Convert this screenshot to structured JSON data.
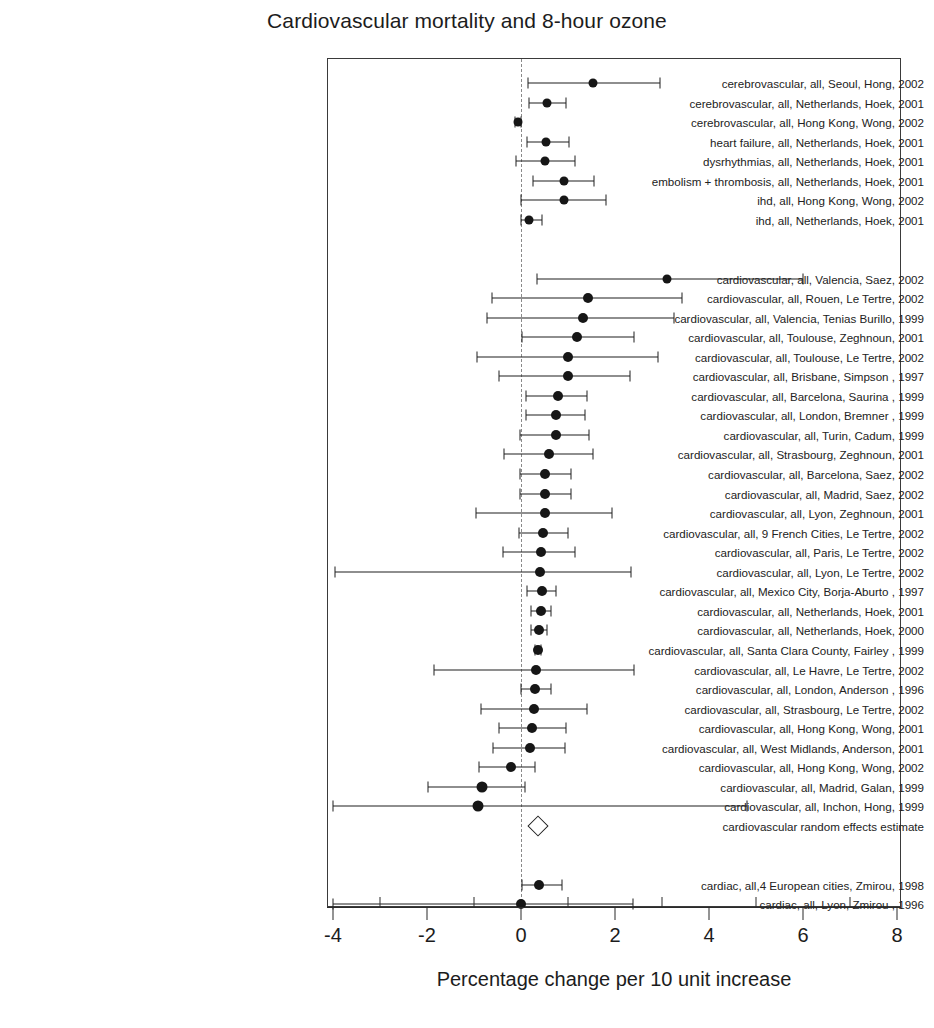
{
  "title": "Cardiovascular mortality and 8-hour ozone",
  "axis": {
    "xlabel": "Percentage change per 10 unit increase",
    "major_ticks": [
      -4,
      -2,
      0,
      2,
      4,
      6,
      8
    ],
    "major_tick_labels": [
      "-4",
      "-2",
      "0",
      "2",
      "4",
      "6",
      "8"
    ],
    "minor_ticks": [
      -3,
      -1,
      1,
      3,
      5,
      7
    ],
    "xlim": [
      -4,
      8
    ],
    "reference_line": 0
  },
  "colors": {
    "marker": "#161616",
    "line": "#1f1f1f",
    "frame": "#3a3a3a",
    "reference": "#8a8a8a",
    "text": "#222222",
    "background": "#ffffff"
  },
  "chart_data": {
    "type": "scatter",
    "plot_style": "forest-plot",
    "title": "Cardiovascular mortality and 8-hour ozone",
    "xlabel": "Percentage change per 10 unit increase",
    "ylabel": "",
    "xlim": [
      -4,
      8
    ],
    "grid": false,
    "legend": "none",
    "reference_line": 0,
    "rows": [
      {
        "label": "cerebrovascular, all, Seoul, Hong, 2002",
        "estimate": 1.53,
        "ci_low": 0.15,
        "ci_high": 2.96,
        "marker": "circle",
        "size": 9
      },
      {
        "label": "cerebrovascular, all, Netherlands, Hoek, 2001",
        "estimate": 0.55,
        "ci_low": 0.18,
        "ci_high": 0.95,
        "marker": "circle",
        "size": 9
      },
      {
        "label": "cerebrovascular, all, Hong Kong, Wong, 2002",
        "estimate": -0.06,
        "ci_low": -0.12,
        "ci_high": 0.01,
        "marker": "circle",
        "size": 9
      },
      {
        "label": "heart failure, all, Netherlands, Hoek, 2001",
        "estimate": 0.53,
        "ci_low": 0.12,
        "ci_high": 1.02,
        "marker": "circle",
        "size": 9
      },
      {
        "label": "dysrhythmias, all, Netherlands, Hoek, 2001",
        "estimate": 0.52,
        "ci_low": -0.11,
        "ci_high": 1.15,
        "marker": "circle",
        "size": 9
      },
      {
        "label": "embolism + thrombosis, all, Netherlands, Hoek, 2001",
        "estimate": 0.92,
        "ci_low": 0.25,
        "ci_high": 1.55,
        "marker": "circle",
        "size": 9
      },
      {
        "label": "ihd, all, Hong Kong, Wong, 2002",
        "estimate": 0.92,
        "ci_low": 0.01,
        "ci_high": 1.8,
        "marker": "circle",
        "size": 9
      },
      {
        "label": "ihd, all, Netherlands, Hoek, 2001",
        "estimate": 0.18,
        "ci_low": -0.01,
        "ci_high": 0.45,
        "marker": "circle",
        "size": 9
      },
      {
        "label": "",
        "spacer": true
      },
      {
        "label": "",
        "spacer": true
      },
      {
        "label": "cardiovascular, all, Valencia, Saez, 2002",
        "estimate": 3.1,
        "ci_low": 0.35,
        "ci_high": 6.0,
        "marker": "circle",
        "size": 9
      },
      {
        "label": "cardiovascular, all, Rouen, Le Tertre, 2002",
        "estimate": 1.42,
        "ci_low": -0.62,
        "ci_high": 3.42,
        "marker": "circle",
        "size": 10
      },
      {
        "label": "cardiovascular, all, Valencia, Tenias Burillo, 1999",
        "estimate": 1.32,
        "ci_low": -0.73,
        "ci_high": 3.25,
        "marker": "circle",
        "size": 10
      },
      {
        "label": "cardiovascular, all, Toulouse, Zeghnoun, 2001",
        "estimate": 1.2,
        "ci_low": 0.03,
        "ci_high": 2.4,
        "marker": "circle",
        "size": 10
      },
      {
        "label": "cardiovascular, all, Toulouse, Le Tertre, 2002",
        "estimate": 1.0,
        "ci_low": -0.93,
        "ci_high": 2.92,
        "marker": "circle",
        "size": 10
      },
      {
        "label": "cardiovascular, all, Brisbane, Simpson , 1997",
        "estimate": 1.0,
        "ci_low": -0.46,
        "ci_high": 2.32,
        "marker": "circle",
        "size": 10
      },
      {
        "label": "cardiovascular, all, Barcelona, Saurina , 1999",
        "estimate": 0.78,
        "ci_low": 0.1,
        "ci_high": 1.4,
        "marker": "circle",
        "size": 10
      },
      {
        "label": "cardiovascular, all, London, Bremner , 1999",
        "estimate": 0.75,
        "ci_low": 0.1,
        "ci_high": 1.36,
        "marker": "circle",
        "size": 10
      },
      {
        "label": "cardiovascular, all, Turin, Cadum, 1999",
        "estimate": 0.74,
        "ci_low": -0.03,
        "ci_high": 1.45,
        "marker": "circle",
        "size": 10
      },
      {
        "label": "cardiovascular, all, Strasbourg, Zeghnoun, 2001",
        "estimate": 0.6,
        "ci_low": -0.37,
        "ci_high": 1.53,
        "marker": "circle",
        "size": 10
      },
      {
        "label": "cardiovascular, all, Barcelona, Saez, 2002",
        "estimate": 0.51,
        "ci_low": -0.02,
        "ci_high": 1.07,
        "marker": "circle",
        "size": 10
      },
      {
        "label": "cardiovascular, all, Madrid, Saez, 2002",
        "estimate": 0.51,
        "ci_low": -0.03,
        "ci_high": 1.07,
        "marker": "circle",
        "size": 10
      },
      {
        "label": "cardiovascular, all, Lyon, Zeghnoun, 2001",
        "estimate": 0.5,
        "ci_low": -0.95,
        "ci_high": 1.93,
        "marker": "circle",
        "size": 10
      },
      {
        "label": "cardiovascular, all, 9 French Cities, Le Tertre, 2002",
        "estimate": 0.47,
        "ci_low": -0.05,
        "ci_high": 1.0,
        "marker": "circle",
        "size": 10
      },
      {
        "label": "cardiovascular, all, Paris, Le Tertre, 2002",
        "estimate": 0.42,
        "ci_low": -0.38,
        "ci_high": 1.14,
        "marker": "circle",
        "size": 10
      },
      {
        "label": "cardiovascular, all, Lyon, Le Tertre, 2002",
        "estimate": 0.4,
        "ci_low": -3.95,
        "ci_high": 2.33,
        "marker": "circle",
        "size": 10
      },
      {
        "label": "cardiovascular, all, Mexico City, Borja-Aburto , 1997",
        "estimate": 0.45,
        "ci_low": 0.13,
        "ci_high": 0.75,
        "marker": "circle",
        "size": 10
      },
      {
        "label": "cardiovascular, all, Netherlands, Hoek, 2001",
        "estimate": 0.42,
        "ci_low": 0.22,
        "ci_high": 0.63,
        "marker": "circle",
        "size": 10
      },
      {
        "label": "cardiovascular, all, Netherlands, Hoek, 2000",
        "estimate": 0.38,
        "ci_low": 0.22,
        "ci_high": 0.55,
        "marker": "circle",
        "size": 10
      },
      {
        "label": "cardiovascular, all, Santa Clara County, Fairley , 1999",
        "estimate": 0.36,
        "ci_low": 0.3,
        "ci_high": 0.42,
        "marker": "circle",
        "size": 10
      },
      {
        "label": "cardiovascular, all, Le Havre, Le Tertre, 2002",
        "estimate": 0.32,
        "ci_low": -1.85,
        "ci_high": 2.4,
        "marker": "circle",
        "size": 10
      },
      {
        "label": "cardiovascular, all, London, Anderson , 1996",
        "estimate": 0.3,
        "ci_low": 0.0,
        "ci_high": 0.63,
        "marker": "circle",
        "size": 10
      },
      {
        "label": "cardiovascular, all, Strasbourg, Le Tertre, 2002",
        "estimate": 0.28,
        "ci_low": -0.85,
        "ci_high": 1.4,
        "marker": "circle",
        "size": 10
      },
      {
        "label": "cardiovascular, all, Hong Kong, Wong, 2001",
        "estimate": 0.24,
        "ci_low": -0.47,
        "ci_high": 0.95,
        "marker": "circle",
        "size": 10
      },
      {
        "label": "cardiovascular, all, West Midlands, Anderson, 2001",
        "estimate": 0.2,
        "ci_low": -0.6,
        "ci_high": 0.94,
        "marker": "circle",
        "size": 10
      },
      {
        "label": "cardiovascular, all, Hong Kong, Wong, 2002",
        "estimate": -0.22,
        "ci_low": -0.9,
        "ci_high": 0.3,
        "marker": "circle",
        "size": 10
      },
      {
        "label": "cardiovascular, all, Madrid, Galan, 1999",
        "estimate": -0.83,
        "ci_low": -1.98,
        "ci_high": 0.08,
        "marker": "circle",
        "size": 11
      },
      {
        "label": "cardiovascular, all, Inchon, Hong, 1999",
        "estimate": -0.91,
        "ci_low": -4.0,
        "ci_high": 4.8,
        "marker": "circle",
        "size": 11
      },
      {
        "label": "cardiovascular random effects estimate",
        "estimate": 0.36,
        "ci_low": 0.22,
        "ci_high": 0.52,
        "marker": "diamond",
        "size": 13
      },
      {
        "label": "",
        "spacer": true
      },
      {
        "label": "",
        "spacer": true
      },
      {
        "label": "cardiac, all,4 European cities, Zmirou, 1998",
        "estimate": 0.38,
        "ci_low": 0.02,
        "ci_high": 0.88,
        "marker": "circle",
        "size": 10
      },
      {
        "label": "cardiac, all, Lyon, Zmirou , 1996",
        "estimate": 0.0,
        "ci_low": -4.0,
        "ci_high": 2.38,
        "marker": "circle",
        "size": 10
      }
    ]
  }
}
